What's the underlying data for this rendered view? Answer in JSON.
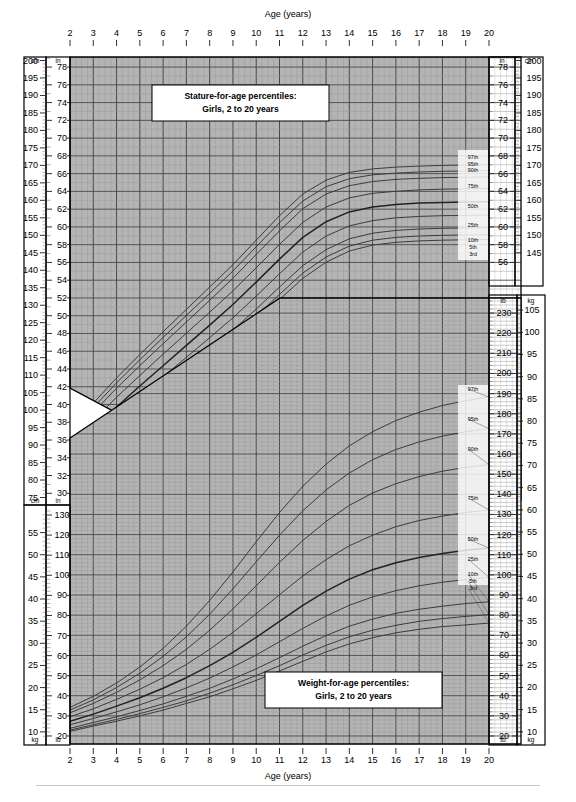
{
  "chart_data": {
    "type": "line",
    "xlabel": "Age (years)",
    "xlim": [
      2,
      20
    ],
    "xticks": [
      2,
      3,
      4,
      5,
      6,
      7,
      8,
      9,
      10,
      11,
      12,
      13,
      14,
      15,
      16,
      17,
      18,
      19,
      20
    ],
    "grid": true,
    "legend_position": "right-inside",
    "panels": [
      {
        "id": "stature",
        "title_line1": "Stature-for-age percentiles:",
        "title_line2": "Girls, 2 to 20 years",
        "ylabel_primary": "cm",
        "ylabel_secondary": "in",
        "ylim_cm": [
          75,
          200
        ],
        "ylim_in": [
          30,
          79
        ],
        "yticks_cm_left": [
          200,
          195,
          190,
          185,
          180,
          175,
          170,
          165,
          160,
          155,
          150,
          145,
          140,
          135,
          130,
          125,
          120,
          115,
          110,
          105,
          100,
          95,
          90,
          85,
          80,
          75
        ],
        "yticks_in_left": [
          78,
          76,
          74,
          72,
          70,
          68,
          66,
          64,
          62,
          60,
          58,
          56,
          54,
          52,
          50,
          48,
          46,
          44,
          42,
          40,
          38,
          36,
          34,
          32,
          30
        ],
        "yticks_in_right": [
          78,
          76,
          74,
          72,
          70,
          68,
          66,
          64,
          62,
          60,
          58,
          56
        ],
        "yticks_cm_right": [
          200,
          195,
          190,
          185,
          180,
          175,
          170,
          165,
          160,
          155,
          150,
          145
        ],
        "percentile_labels": [
          "97th",
          "95th",
          "90th",
          "75th",
          "50th",
          "25th",
          "10th",
          "5th",
          "3rd"
        ],
        "x": [
          2,
          3,
          4,
          5,
          6,
          7,
          8,
          9,
          10,
          11,
          12,
          13,
          14,
          15,
          16,
          17,
          18,
          19,
          20
        ],
        "series": [
          {
            "name": "97th",
            "unit": "cm",
            "values": [
              95.0,
              102.0,
              109.2,
              115.9,
              122.4,
              128.8,
              135.2,
              141.6,
              148.6,
              155.6,
              161.8,
              165.8,
              168.0,
              169.0,
              169.5,
              169.8,
              170.0,
              170.1,
              170.2
            ]
          },
          {
            "name": "95th",
            "unit": "cm",
            "values": [
              93.8,
              100.7,
              107.8,
              114.4,
              120.8,
              127.1,
              133.4,
              139.8,
              146.7,
              153.6,
              159.8,
              163.9,
              166.2,
              167.3,
              167.8,
              168.1,
              168.3,
              168.4,
              168.5
            ]
          },
          {
            "name": "90th",
            "unit": "cm",
            "values": [
              92.5,
              99.3,
              106.3,
              112.7,
              119.0,
              125.2,
              131.4,
              137.7,
              144.5,
              151.3,
              157.6,
              161.8,
              164.2,
              165.4,
              166.0,
              166.3,
              166.5,
              166.6,
              166.7
            ]
          },
          {
            "name": "75th",
            "unit": "cm",
            "values": [
              90.3,
              96.9,
              103.7,
              109.9,
              116.0,
              122.0,
              128.0,
              134.1,
              140.7,
              147.4,
              153.7,
              158.1,
              160.7,
              162.0,
              162.6,
              163.0,
              163.2,
              163.3,
              163.4
            ]
          },
          {
            "name": "50th",
            "unit": "cm",
            "values": [
              87.9,
              94.3,
              100.9,
              106.9,
              112.7,
              118.5,
              124.3,
              130.2,
              136.6,
              143.2,
              149.4,
              153.9,
              156.7,
              158.1,
              158.8,
              159.2,
              159.4,
              159.5,
              159.6
            ]
          },
          {
            "name": "25th",
            "unit": "cm",
            "values": [
              85.6,
              91.7,
              98.1,
              103.9,
              109.5,
              115.1,
              120.7,
              126.4,
              132.6,
              139.0,
              145.2,
              149.8,
              152.7,
              154.2,
              155.0,
              155.4,
              155.6,
              155.7,
              155.8
            ]
          },
          {
            "name": "10th",
            "unit": "cm",
            "values": [
              83.5,
              89.4,
              95.6,
              101.2,
              106.7,
              112.0,
              117.4,
              122.9,
              128.9,
              135.2,
              141.3,
              145.9,
              149.0,
              150.6,
              151.4,
              151.8,
              152.0,
              152.1,
              152.2
            ]
          },
          {
            "name": "5th",
            "unit": "cm",
            "values": [
              82.3,
              88.1,
              94.2,
              99.7,
              105.0,
              110.3,
              115.6,
              121.0,
              126.9,
              133.1,
              139.2,
              143.8,
              146.9,
              148.6,
              149.4,
              149.8,
              150.0,
              150.1,
              150.2
            ]
          },
          {
            "name": "3rd",
            "unit": "cm",
            "values": [
              81.4,
              87.2,
              93.2,
              98.6,
              103.9,
              109.1,
              114.3,
              119.7,
              125.5,
              131.6,
              137.7,
              142.3,
              145.5,
              147.2,
              148.0,
              148.4,
              148.6,
              148.7,
              148.8
            ]
          }
        ]
      },
      {
        "id": "weight",
        "title_line1": "Weight-for-age percentiles:",
        "title_line2": "Girls, 2 to 20 years",
        "ylabel_primary": "kg",
        "ylabel_secondary": "lb",
        "ylim_kg_left": [
          8,
          60
        ],
        "ylim_lb_left": [
          20,
          132
        ],
        "yticks_kg_left": [
          55,
          50,
          45,
          40,
          35,
          30,
          25,
          20,
          15,
          10
        ],
        "yticks_lb_left": [
          130,
          120,
          110,
          100,
          90,
          80,
          70,
          60,
          50,
          40,
          30,
          20
        ],
        "yticks_lb_right": [
          230,
          220,
          210,
          200,
          190,
          180,
          170,
          160,
          150,
          140,
          130,
          120,
          110,
          100,
          90,
          80,
          70,
          60,
          50,
          40,
          30,
          20
        ],
        "yticks_kg_right": [
          105,
          100,
          95,
          90,
          85,
          80,
          75,
          70,
          65,
          60,
          55,
          50,
          45,
          40,
          35,
          30,
          25,
          20,
          15,
          10
        ],
        "percentile_labels": [
          "97th",
          "95th",
          "90th",
          "75th",
          "50th",
          "25th",
          "10th",
          "5th",
          "3rd"
        ],
        "x": [
          2,
          3,
          4,
          5,
          6,
          7,
          8,
          9,
          10,
          11,
          12,
          13,
          14,
          15,
          16,
          17,
          18,
          19,
          20
        ],
        "series": [
          {
            "name": "97th",
            "unit": "kg",
            "values": [
              15.5,
              18.0,
              21.0,
              24.6,
              28.8,
              33.8,
              39.6,
              46.0,
              52.8,
              59.4,
              65.3,
              70.3,
              74.4,
              77.6,
              80.1,
              82.0,
              83.5,
              84.6,
              85.4
            ]
          },
          {
            "name": "95th",
            "unit": "kg",
            "values": [
              14.9,
              17.2,
              20.0,
              23.2,
              27.0,
              31.4,
              36.5,
              42.2,
              48.3,
              54.3,
              59.8,
              64.5,
              68.3,
              71.3,
              73.6,
              75.3,
              76.6,
              77.6,
              78.3
            ]
          },
          {
            "name": "90th",
            "unit": "kg",
            "values": [
              14.3,
              16.4,
              18.9,
              21.7,
              24.9,
              28.6,
              32.9,
              37.7,
              42.9,
              48.2,
              53.1,
              57.4,
              61.0,
              63.8,
              65.9,
              67.5,
              68.7,
              69.6,
              70.2
            ]
          },
          {
            "name": "75th",
            "unit": "kg",
            "values": [
              13.4,
              15.2,
              17.3,
              19.6,
              22.2,
              25.2,
              28.6,
              32.4,
              36.6,
              40.9,
              45.1,
              48.8,
              51.9,
              54.3,
              56.2,
              57.6,
              58.6,
              59.4,
              60.0
            ]
          },
          {
            "name": "50th",
            "unit": "kg",
            "values": [
              12.4,
              14.0,
              15.8,
              17.7,
              19.8,
              22.2,
              24.9,
              27.9,
              31.3,
              34.9,
              38.5,
              41.7,
              44.4,
              46.5,
              48.1,
              49.3,
              50.2,
              50.9,
              51.4
            ]
          },
          {
            "name": "25th",
            "unit": "kg",
            "values": [
              11.6,
              13.0,
              14.5,
              16.1,
              17.9,
              19.9,
              22.1,
              24.6,
              27.3,
              30.3,
              33.3,
              36.1,
              38.5,
              40.4,
              41.8,
              42.9,
              43.7,
              44.3,
              44.8
            ]
          },
          {
            "name": "10th",
            "unit": "kg",
            "values": [
              10.8,
              12.1,
              13.4,
              14.8,
              16.3,
              18.0,
              19.8,
              21.9,
              24.2,
              26.7,
              29.3,
              31.7,
              33.8,
              35.4,
              36.7,
              37.6,
              38.3,
              38.9,
              39.3
            ]
          },
          {
            "name": "5th",
            "unit": "kg",
            "values": [
              10.4,
              11.6,
              12.8,
              14.1,
              15.5,
              17.0,
              18.7,
              20.6,
              22.7,
              24.9,
              27.3,
              29.5,
              31.4,
              32.9,
              34.0,
              34.9,
              35.5,
              36.0,
              36.4
            ]
          },
          {
            "name": "3rd",
            "unit": "kg",
            "values": [
              10.1,
              11.3,
              12.4,
              13.6,
              14.9,
              16.4,
              17.9,
              19.7,
              21.6,
              23.7,
              25.9,
              28.0,
              29.8,
              31.2,
              32.3,
              33.1,
              33.7,
              34.1,
              34.5
            ]
          }
        ]
      }
    ]
  },
  "header": {
    "age_axis_label_top": "Age (years)",
    "age_axis_label_bottom": "Age (years)"
  },
  "stature_box": {
    "line1": "Stature-for-age percentiles:",
    "line2": "Girls, 2 to 20 years"
  },
  "weight_box": {
    "line1": "Weight-for-age percentiles:",
    "line2": "Girls, 2 to 20 years"
  },
  "units": {
    "cm": "cm",
    "in": "in",
    "kg": "kg",
    "lb": "lb"
  },
  "colors": {
    "grid_background": "#b4b4b4",
    "grid_line_minor": "#9a9a9a",
    "grid_line_major": "#4a4a4a",
    "curve": "#3c3c3c",
    "curve_major": "#222222",
    "frame": "#000000",
    "page": "#ffffff"
  }
}
